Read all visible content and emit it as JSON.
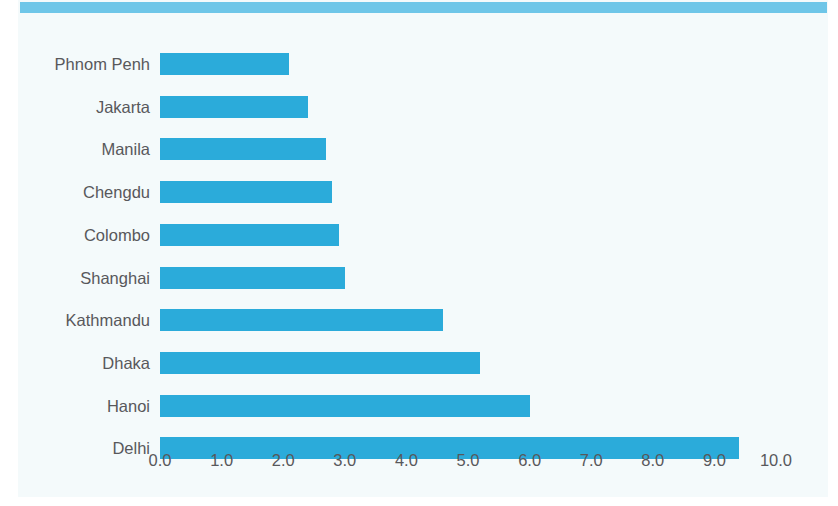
{
  "figure": {
    "background_color": "#f4fafb",
    "accent_color": "#6ec6e8",
    "bar_color": "#2babda",
    "text_color": "#58585b"
  },
  "top_band": {
    "name": "decorative-header-band"
  },
  "chart_data": {
    "type": "bar",
    "orientation": "horizontal",
    "title": "",
    "subtitle": "",
    "xlabel": "",
    "ylabel": "",
    "categories": [
      "Phnom Penh",
      "Jakarta",
      "Manila",
      "Chengdu",
      "Colombo",
      "Shanghai",
      "Kathmandu",
      "Dhaka",
      "Hanoi",
      "Delhi"
    ],
    "values": [
      2.1,
      2.4,
      2.7,
      2.8,
      2.9,
      3.0,
      4.6,
      5.2,
      6.0,
      9.4
    ],
    "xlim": [
      0.0,
      10.0
    ],
    "ylim": null,
    "xticks": [
      0.0,
      1.0,
      2.0,
      3.0,
      4.0,
      5.0,
      6.0,
      7.0,
      8.0,
      9.0,
      10.0
    ],
    "xtick_labels": [
      "0.0",
      "1.0",
      "2.0",
      "3.0",
      "4.0",
      "5.0",
      "6.0",
      "7.0",
      "8.0",
      "9.0",
      "10.0"
    ],
    "grid": false,
    "legend": null,
    "legend_position": "none",
    "annotations": [],
    "series": [
      {
        "name": "value",
        "values": [
          2.1,
          2.4,
          2.7,
          2.8,
          2.9,
          3.0,
          4.6,
          5.2,
          6.0,
          9.4
        ]
      }
    ]
  }
}
